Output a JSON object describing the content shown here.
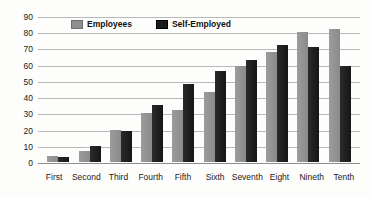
{
  "chart_data": {
    "type": "bar",
    "categories": [
      "First",
      "Second",
      "Third",
      "Fourth",
      "Fifth",
      "Sixth",
      "Seventh",
      "Eight",
      "Nineth",
      "Tenth"
    ],
    "series": [
      {
        "name": "Employees",
        "color": "#8f8f8f",
        "values": [
          4,
          7,
          20,
          30,
          32,
          43,
          59,
          68,
          80,
          82
        ]
      },
      {
        "name": "Self-Employed",
        "color": "#1b1b1b",
        "values": [
          3,
          10,
          19,
          35,
          48,
          56,
          63,
          72,
          71,
          59
        ]
      }
    ],
    "title": "",
    "xlabel": "",
    "ylabel": "",
    "ylim": [
      0,
      90
    ],
    "ytick_step": 10,
    "grid": true,
    "legend_position": "top-inside"
  },
  "colors": {
    "background": "#fdfdfb",
    "gridline": "#b9b9b9",
    "axis_line": "#8e8e8e",
    "text": "#1c1c1c"
  }
}
